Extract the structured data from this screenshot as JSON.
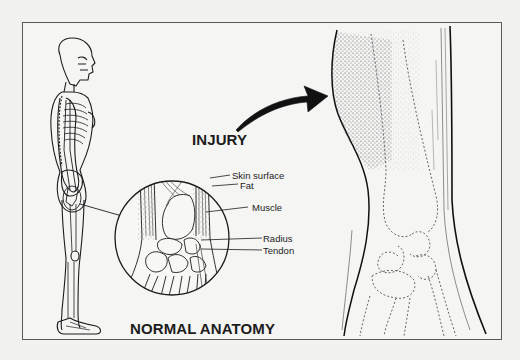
{
  "figure": {
    "labels": {
      "injury": "INJURY",
      "normal_anatomy": "NORMAL ANATOMY"
    },
    "callouts": [
      {
        "label": "Skin surface"
      },
      {
        "label": "Fat"
      },
      {
        "label": "Muscle"
      },
      {
        "label": "Radius"
      },
      {
        "label": "Tendon"
      }
    ],
    "panels": [
      {
        "name": "full-body skeleton side view"
      },
      {
        "name": "magnified normal wrist cross-section"
      },
      {
        "name": "injured swollen wrist with bruising"
      }
    ],
    "colors": {
      "line": "#1c1c1c",
      "frame": "#5a5a5a",
      "background": "#f5f5f4",
      "dashed_bone": "#555555"
    }
  }
}
